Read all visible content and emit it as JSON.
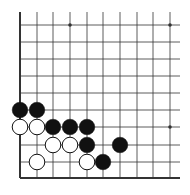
{
  "board": {
    "description": "Go board corner (lower-left), 10 columns x 10 rows visible",
    "columns_x": [
      20,
      37,
      53,
      70,
      87,
      103,
      120,
      137,
      153,
      170
    ],
    "rows_y": [
      25,
      42,
      59,
      76,
      93,
      110,
      127,
      145,
      162,
      178
    ],
    "star_points": [
      [
        3,
        0
      ],
      [
        9,
        0
      ],
      [
        9,
        6
      ]
    ],
    "stones": [
      {
        "color": "black",
        "col": 0,
        "row": 5
      },
      {
        "color": "black",
        "col": 1,
        "row": 5
      },
      {
        "color": "white",
        "col": 0,
        "row": 6
      },
      {
        "color": "white",
        "col": 1,
        "row": 6
      },
      {
        "color": "black",
        "col": 2,
        "row": 6
      },
      {
        "color": "black",
        "col": 3,
        "row": 6
      },
      {
        "color": "black",
        "col": 4,
        "row": 6
      },
      {
        "color": "white",
        "col": 2,
        "row": 7
      },
      {
        "color": "white",
        "col": 3,
        "row": 7
      },
      {
        "color": "black",
        "col": 4,
        "row": 7
      },
      {
        "color": "black",
        "col": 6,
        "row": 7
      },
      {
        "color": "white",
        "col": 1,
        "row": 8
      },
      {
        "color": "white",
        "col": 4,
        "row": 8
      },
      {
        "color": "black",
        "col": 5,
        "row": 8
      }
    ],
    "colors": {
      "line": "#333333",
      "black_stone": "#111111",
      "white_stone": "#ffffff",
      "background": "#ffffff"
    }
  }
}
